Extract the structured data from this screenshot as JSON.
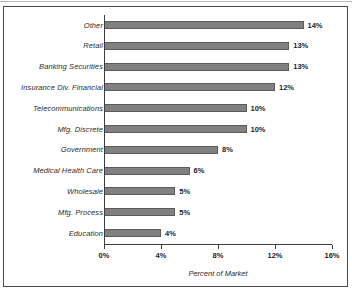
{
  "chart_data": {
    "type": "bar",
    "orientation": "horizontal",
    "title": "",
    "xlabel": "Percent of Market",
    "ylabel": "",
    "xlim": [
      0,
      16
    ],
    "xticks": [
      0,
      4,
      8,
      12,
      16
    ],
    "xtick_labels": [
      "0%",
      "4%",
      "8%",
      "12%",
      "16%"
    ],
    "grid": false,
    "legend": "none",
    "value_suffix": "%",
    "categories": [
      "Other",
      "Retail",
      "Banking Securities",
      "Insurance Div. Financial",
      "Telecommunications",
      "Mfg. Discrete",
      "Government",
      "Medical Health Care",
      "Wholesale",
      "Mfg. Process",
      "Education"
    ],
    "values": [
      14,
      13,
      13,
      12,
      10,
      10,
      8,
      6,
      5,
      5,
      4
    ],
    "data_labels": [
      "14%",
      "13%",
      "13%",
      "12%",
      "10%",
      "10%",
      "8%",
      "6%",
      "5%",
      "5%",
      "4%"
    ],
    "colors": {
      "bar_fill": "#808080",
      "bar_outline": "#5c5c5c",
      "axis": "#3d3d3d",
      "text": "#1d1d1d",
      "frame": "#4a4a4a",
      "background": "#ffffff"
    }
  }
}
